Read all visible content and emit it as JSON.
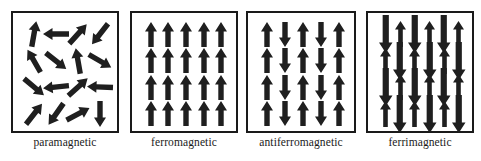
{
  "figure": {
    "background_color": "#ffffff",
    "arrow_color": "#1f1f1f",
    "border_color": "#1a1a1a",
    "panel_count": 4
  },
  "panels": [
    {
      "id": "paramagnetic",
      "label": "paramagnetic",
      "box": {
        "x": 11,
        "y": 11,
        "w": 108,
        "h": 122
      },
      "caption_y": 136,
      "grid": {
        "cols": 4,
        "rows": 4
      },
      "description": "randomly oriented magnetic moments",
      "arrow_style": "uniform",
      "arrows": [
        {
          "col": 0,
          "row": 0,
          "angle": 10,
          "length": 26
        },
        {
          "col": 1,
          "row": 0,
          "angle": 270,
          "length": 26
        },
        {
          "col": 2,
          "row": 0,
          "angle": 42,
          "length": 26
        },
        {
          "col": 3,
          "row": 0,
          "angle": 218,
          "length": 26
        },
        {
          "col": 0,
          "row": 1,
          "angle": 330,
          "length": 26
        },
        {
          "col": 1,
          "row": 1,
          "angle": 128,
          "length": 26
        },
        {
          "col": 2,
          "row": 1,
          "angle": 350,
          "length": 26
        },
        {
          "col": 3,
          "row": 1,
          "angle": 120,
          "length": 26
        },
        {
          "col": 0,
          "row": 2,
          "angle": 130,
          "length": 26
        },
        {
          "col": 1,
          "row": 2,
          "angle": 264,
          "length": 26
        },
        {
          "col": 2,
          "row": 2,
          "angle": 48,
          "length": 26
        },
        {
          "col": 3,
          "row": 2,
          "angle": 272,
          "length": 26
        },
        {
          "col": 0,
          "row": 3,
          "angle": 38,
          "length": 26
        },
        {
          "col": 1,
          "row": 3,
          "angle": 215,
          "length": 26
        },
        {
          "col": 2,
          "row": 3,
          "angle": 62,
          "length": 26
        },
        {
          "col": 3,
          "row": 3,
          "angle": 180,
          "length": 26
        }
      ]
    },
    {
      "id": "ferromagnetic",
      "label": "ferromagnetic",
      "box": {
        "x": 130,
        "y": 11,
        "w": 108,
        "h": 122
      },
      "caption_y": 136,
      "grid": {
        "cols": 5,
        "rows": 4
      },
      "description": "all magnetic moments aligned parallel, pointing up",
      "arrow_style": "uniform",
      "arrows": [
        {
          "col": 0,
          "row": 0,
          "angle": 0,
          "length": 25
        },
        {
          "col": 1,
          "row": 0,
          "angle": 0,
          "length": 25
        },
        {
          "col": 2,
          "row": 0,
          "angle": 0,
          "length": 25
        },
        {
          "col": 3,
          "row": 0,
          "angle": 0,
          "length": 25
        },
        {
          "col": 4,
          "row": 0,
          "angle": 0,
          "length": 25
        },
        {
          "col": 0,
          "row": 1,
          "angle": 0,
          "length": 25
        },
        {
          "col": 1,
          "row": 1,
          "angle": 0,
          "length": 25
        },
        {
          "col": 2,
          "row": 1,
          "angle": 0,
          "length": 25
        },
        {
          "col": 3,
          "row": 1,
          "angle": 0,
          "length": 25
        },
        {
          "col": 4,
          "row": 1,
          "angle": 0,
          "length": 25
        },
        {
          "col": 0,
          "row": 2,
          "angle": 0,
          "length": 25
        },
        {
          "col": 1,
          "row": 2,
          "angle": 0,
          "length": 25
        },
        {
          "col": 2,
          "row": 2,
          "angle": 0,
          "length": 25
        },
        {
          "col": 3,
          "row": 2,
          "angle": 0,
          "length": 25
        },
        {
          "col": 4,
          "row": 2,
          "angle": 0,
          "length": 25
        },
        {
          "col": 0,
          "row": 3,
          "angle": 0,
          "length": 25
        },
        {
          "col": 1,
          "row": 3,
          "angle": 0,
          "length": 25
        },
        {
          "col": 2,
          "row": 3,
          "angle": 0,
          "length": 25
        },
        {
          "col": 3,
          "row": 3,
          "angle": 0,
          "length": 25
        },
        {
          "col": 4,
          "row": 3,
          "angle": 0,
          "length": 25
        }
      ]
    },
    {
      "id": "antiferromagnetic",
      "label": "antiferromagnetic",
      "box": {
        "x": 246,
        "y": 11,
        "w": 110,
        "h": 122
      },
      "caption_y": 136,
      "grid": {
        "cols": 5,
        "rows": 4
      },
      "description": "alternating up and down moments of equal magnitude by column",
      "arrow_style": "uniform",
      "arrows": [
        {
          "col": 0,
          "row": 0,
          "angle": 0,
          "length": 25
        },
        {
          "col": 1,
          "row": 0,
          "angle": 180,
          "length": 25
        },
        {
          "col": 2,
          "row": 0,
          "angle": 0,
          "length": 25
        },
        {
          "col": 3,
          "row": 0,
          "angle": 180,
          "length": 25
        },
        {
          "col": 4,
          "row": 0,
          "angle": 0,
          "length": 25
        },
        {
          "col": 0,
          "row": 1,
          "angle": 0,
          "length": 25
        },
        {
          "col": 1,
          "row": 1,
          "angle": 180,
          "length": 25
        },
        {
          "col": 2,
          "row": 1,
          "angle": 0,
          "length": 25
        },
        {
          "col": 3,
          "row": 1,
          "angle": 180,
          "length": 25
        },
        {
          "col": 4,
          "row": 1,
          "angle": 0,
          "length": 25
        },
        {
          "col": 0,
          "row": 2,
          "angle": 0,
          "length": 25
        },
        {
          "col": 1,
          "row": 2,
          "angle": 180,
          "length": 25
        },
        {
          "col": 2,
          "row": 2,
          "angle": 0,
          "length": 25
        },
        {
          "col": 3,
          "row": 2,
          "angle": 180,
          "length": 25
        },
        {
          "col": 4,
          "row": 2,
          "angle": 0,
          "length": 25
        },
        {
          "col": 0,
          "row": 3,
          "angle": 0,
          "length": 25
        },
        {
          "col": 1,
          "row": 3,
          "angle": 180,
          "length": 25
        },
        {
          "col": 2,
          "row": 3,
          "angle": 0,
          "length": 25
        },
        {
          "col": 3,
          "row": 3,
          "angle": 180,
          "length": 25
        },
        {
          "col": 4,
          "row": 3,
          "angle": 0,
          "length": 25
        }
      ]
    },
    {
      "id": "ferrimagnetic",
      "label": "ferrimagnetic",
      "box": {
        "x": 366,
        "y": 11,
        "w": 108,
        "h": 122
      },
      "caption_y": 136,
      "grid": {
        "cols": 6,
        "rows": 4
      },
      "description": "antiparallel moments of unequal magnitude; long down arrows alternate with short up arrows",
      "arrow_style": "alternating-magnitude",
      "arrows": [
        {
          "col": 0,
          "row": 0,
          "angle": 180,
          "length": 38,
          "weight": "large"
        },
        {
          "col": 1,
          "row": 0,
          "angle": 0,
          "length": 26,
          "weight": "small"
        },
        {
          "col": 2,
          "row": 0,
          "angle": 180,
          "length": 38,
          "weight": "large"
        },
        {
          "col": 3,
          "row": 0,
          "angle": 0,
          "length": 26,
          "weight": "small"
        },
        {
          "col": 4,
          "row": 0,
          "angle": 180,
          "length": 38,
          "weight": "large"
        },
        {
          "col": 5,
          "row": 0,
          "angle": 0,
          "length": 26,
          "weight": "small"
        },
        {
          "col": 0,
          "row": 1,
          "angle": 0,
          "length": 26,
          "weight": "small"
        },
        {
          "col": 1,
          "row": 1,
          "angle": 180,
          "length": 38,
          "weight": "large"
        },
        {
          "col": 2,
          "row": 1,
          "angle": 0,
          "length": 26,
          "weight": "small"
        },
        {
          "col": 3,
          "row": 1,
          "angle": 180,
          "length": 38,
          "weight": "large"
        },
        {
          "col": 4,
          "row": 1,
          "angle": 0,
          "length": 26,
          "weight": "small"
        },
        {
          "col": 5,
          "row": 1,
          "angle": 180,
          "length": 38,
          "weight": "large"
        },
        {
          "col": 0,
          "row": 2,
          "angle": 180,
          "length": 38,
          "weight": "large"
        },
        {
          "col": 1,
          "row": 2,
          "angle": 0,
          "length": 26,
          "weight": "small"
        },
        {
          "col": 2,
          "row": 2,
          "angle": 180,
          "length": 38,
          "weight": "large"
        },
        {
          "col": 3,
          "row": 2,
          "angle": 0,
          "length": 26,
          "weight": "small"
        },
        {
          "col": 4,
          "row": 2,
          "angle": 180,
          "length": 38,
          "weight": "large"
        },
        {
          "col": 5,
          "row": 2,
          "angle": 0,
          "length": 26,
          "weight": "small"
        },
        {
          "col": 0,
          "row": 3,
          "angle": 0,
          "length": 26,
          "weight": "small"
        },
        {
          "col": 1,
          "row": 3,
          "angle": 180,
          "length": 38,
          "weight": "large"
        },
        {
          "col": 2,
          "row": 3,
          "angle": 0,
          "length": 26,
          "weight": "small"
        },
        {
          "col": 3,
          "row": 3,
          "angle": 180,
          "length": 38,
          "weight": "large"
        },
        {
          "col": 4,
          "row": 3,
          "angle": 0,
          "length": 26,
          "weight": "small"
        },
        {
          "col": 5,
          "row": 3,
          "angle": 180,
          "length": 38,
          "weight": "large"
        }
      ]
    }
  ]
}
